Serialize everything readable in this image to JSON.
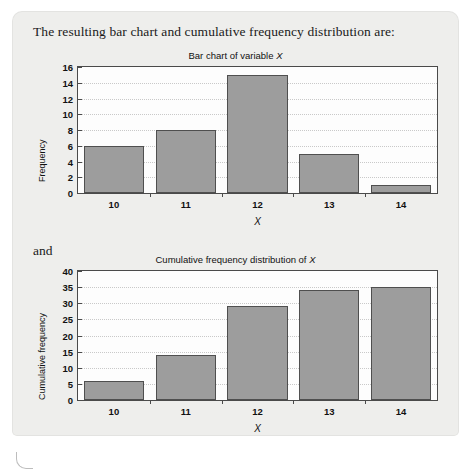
{
  "document": {
    "intro": "The resulting bar chart and cumulative frequency distribution are:",
    "connector": "and"
  },
  "chart_data": [
    {
      "type": "bar",
      "title": "Bar chart of variable X",
      "title_plain": "Bar chart of variable ",
      "title_italic": "X",
      "categories": [
        "10",
        "11",
        "12",
        "13",
        "14"
      ],
      "values": [
        6,
        8,
        15,
        5,
        1
      ],
      "xlabel": "X",
      "ylabel": "Frequency",
      "ylim": [
        0,
        16
      ],
      "yticks": [
        "16",
        "14",
        "12",
        "10",
        "8",
        "6",
        "4",
        "2",
        "0"
      ],
      "ytick_values": [
        16,
        14,
        12,
        10,
        8,
        6,
        4,
        2,
        0
      ],
      "grid": true,
      "legend": "none",
      "bar_color": "#9d9d9d",
      "bar_border_color": "#4f4f4f"
    },
    {
      "type": "bar",
      "title": "Cumulative frequency distribution of X",
      "title_plain": "Cumulative frequency distribution of ",
      "title_italic": "X",
      "categories": [
        "10",
        "11",
        "12",
        "13",
        "14"
      ],
      "values": [
        6,
        14,
        29,
        34,
        35
      ],
      "xlabel": "X",
      "ylabel": "Cumulative frequency",
      "ylim": [
        0,
        40
      ],
      "yticks": [
        "40",
        "35",
        "30",
        "25",
        "20",
        "15",
        "10",
        "5",
        "0"
      ],
      "ytick_values": [
        40,
        35,
        30,
        25,
        20,
        15,
        10,
        5,
        0
      ],
      "grid": true,
      "legend": "none",
      "bar_color": "#9d9d9d",
      "bar_border_color": "#4f4f4f"
    }
  ]
}
